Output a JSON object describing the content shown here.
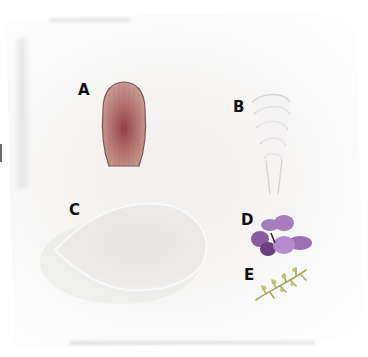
{
  "figure": {
    "background_color": "#f5f4f3",
    "specimens": [
      {
        "label": "A",
        "description": "ribbed shell-shaped petal",
        "color": "#b86f6a"
      },
      {
        "label": "B",
        "description": "pale curled petals",
        "color": "#efeceb"
      },
      {
        "label": "C",
        "description": "large translucent scale",
        "color": "#e9e7e6"
      },
      {
        "label": "D",
        "description": "purple flower",
        "color": "#8f5fa6"
      },
      {
        "label": "E",
        "description": "small green-yellow sprig",
        "color": "#b7b36a"
      }
    ]
  }
}
